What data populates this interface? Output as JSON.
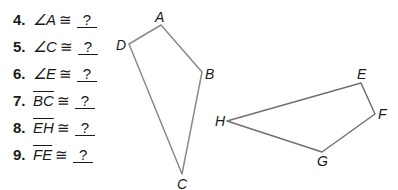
{
  "problems": [
    {
      "number": "4.",
      "angle_symbol": "∠",
      "term": "A",
      "congruent": "≅",
      "answer": "?"
    },
    {
      "number": "5.",
      "angle_symbol": "∠",
      "term": "C",
      "congruent": "≅",
      "answer": "?"
    },
    {
      "number": "6.",
      "angle_symbol": "∠",
      "term": "E",
      "congruent": "≅",
      "answer": "?"
    },
    {
      "number": "7.",
      "term": "BC",
      "congruent": "≅",
      "answer": "?"
    },
    {
      "number": "8.",
      "term": "EH",
      "congruent": "≅",
      "answer": "?"
    },
    {
      "number": "9.",
      "term": "FE",
      "congruent": "≅",
      "answer": "?"
    }
  ],
  "figures": {
    "quad1": {
      "labels": {
        "A": "A",
        "B": "B",
        "C": "C",
        "D": "D"
      }
    },
    "quad2": {
      "labels": {
        "E": "E",
        "F": "F",
        "G": "G",
        "H": "H"
      }
    },
    "stroke_color": "#8a8a8a"
  }
}
